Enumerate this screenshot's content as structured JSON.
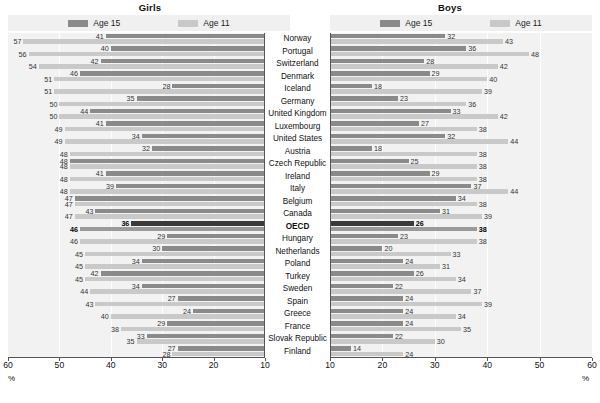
{
  "colors": {
    "age15": "#8a8a8a",
    "age11": "#c9c9c9",
    "age15_highlight": "#3a3a3a",
    "age11_highlight": "#9a9a9a",
    "plot_background": "#f2f2f2",
    "legend_background": "#f0f0f0",
    "axis": "#555555"
  },
  "panels": {
    "girls": {
      "title": "Girls",
      "percent_label": "%"
    },
    "boys": {
      "title": "Boys",
      "percent_label": "%"
    }
  },
  "legend": {
    "age15": "Age 15",
    "age11": "Age 11"
  },
  "axis": {
    "girls_ticks": [
      "60",
      "50",
      "40",
      "30",
      "20",
      "10"
    ],
    "boys_ticks": [
      "10",
      "20",
      "30",
      "40",
      "50",
      "60"
    ]
  },
  "chart_data": [
    {
      "type": "bar",
      "title": "Girls",
      "orientation": "horizontal",
      "direction": "reversed",
      "xlabel": "%",
      "ylabel": "",
      "xlim": [
        10,
        60
      ],
      "grid": true,
      "legend": [
        "Age 15",
        "Age 11"
      ],
      "legend_position": "top",
      "categories": [
        "Norway",
        "Portugal",
        "Switzerland",
        "Denmark",
        "Iceland",
        "Germany",
        "United Kingdom",
        "Luxembourg",
        "United States",
        "Austria",
        "Czech Republic",
        "Ireland",
        "Italy",
        "Belgium",
        "Canada",
        "OECD",
        "Hungary",
        "Netherlands",
        "Poland",
        "Turkey",
        "Sweden",
        "Spain",
        "Greece",
        "France",
        "Slovak Republic",
        "Finland"
      ],
      "series": [
        {
          "name": "Age 15",
          "values": [
            41,
            40,
            42,
            46,
            28,
            35,
            44,
            41,
            34,
            32,
            48,
            41,
            39,
            47,
            43,
            36,
            29,
            30,
            34,
            42,
            34,
            27,
            24,
            29,
            33,
            27
          ]
        },
        {
          "name": "Age 11",
          "values": [
            57,
            56,
            54,
            51,
            51,
            50,
            50,
            49,
            49,
            48,
            48,
            48,
            48,
            47,
            47,
            46,
            46,
            45,
            45,
            45,
            44,
            43,
            40,
            38,
            35,
            28
          ]
        }
      ]
    },
    {
      "type": "bar",
      "title": "Boys",
      "orientation": "horizontal",
      "direction": "normal",
      "xlabel": "%",
      "ylabel": "",
      "xlim": [
        10,
        60
      ],
      "grid": true,
      "legend": [
        "Age 15",
        "Age 11"
      ],
      "legend_position": "top",
      "categories": [
        "Norway",
        "Portugal",
        "Switzerland",
        "Denmark",
        "Iceland",
        "Germany",
        "United Kingdom",
        "Luxembourg",
        "United States",
        "Austria",
        "Czech Republic",
        "Ireland",
        "Italy",
        "Belgium",
        "Canada",
        "OECD",
        "Hungary",
        "Netherlands",
        "Poland",
        "Turkey",
        "Sweden",
        "Spain",
        "Greece",
        "France",
        "Slovak Republic",
        "Finland"
      ],
      "series": [
        {
          "name": "Age 15",
          "values": [
            32,
            36,
            28,
            29,
            18,
            23,
            33,
            27,
            32,
            18,
            25,
            29,
            37,
            34,
            31,
            26,
            23,
            20,
            24,
            26,
            22,
            24,
            24,
            24,
            22,
            14
          ]
        },
        {
          "name": "Age 11",
          "values": [
            43,
            48,
            42,
            40,
            39,
            36,
            42,
            38,
            44,
            38,
            38,
            38,
            44,
            38,
            39,
            38,
            38,
            33,
            31,
            34,
            37,
            39,
            34,
            35,
            30,
            24
          ]
        }
      ]
    }
  ],
  "rows": [
    {
      "country": "Norway",
      "girls15": 41,
      "girls11": 57,
      "boys15": 32,
      "boys11": 43,
      "highlight": false
    },
    {
      "country": "Portugal",
      "girls15": 40,
      "girls11": 56,
      "boys15": 36,
      "boys11": 48,
      "highlight": false
    },
    {
      "country": "Switzerland",
      "girls15": 42,
      "girls11": 54,
      "boys15": 28,
      "boys11": 42,
      "highlight": false
    },
    {
      "country": "Denmark",
      "girls15": 46,
      "girls11": 51,
      "boys15": 29,
      "boys11": 40,
      "highlight": false
    },
    {
      "country": "Iceland",
      "girls15": 28,
      "girls11": 51,
      "boys15": 18,
      "boys11": 39,
      "highlight": false
    },
    {
      "country": "Germany",
      "girls15": 35,
      "girls11": 50,
      "boys15": 23,
      "boys11": 36,
      "highlight": false
    },
    {
      "country": "United Kingdom",
      "girls15": 44,
      "girls11": 50,
      "boys15": 33,
      "boys11": 42,
      "highlight": false
    },
    {
      "country": "Luxembourg",
      "girls15": 41,
      "girls11": 49,
      "boys15": 27,
      "boys11": 38,
      "highlight": false
    },
    {
      "country": "United States",
      "girls15": 34,
      "girls11": 49,
      "boys15": 32,
      "boys11": 44,
      "highlight": false
    },
    {
      "country": "Austria",
      "girls15": 32,
      "girls11": 48,
      "boys15": 18,
      "boys11": 38,
      "highlight": false
    },
    {
      "country": "Czech Republic",
      "girls15": 48,
      "girls11": 48,
      "boys15": 25,
      "boys11": 38,
      "highlight": false
    },
    {
      "country": "Ireland",
      "girls15": 41,
      "girls11": 48,
      "boys15": 29,
      "boys11": 38,
      "highlight": false
    },
    {
      "country": "Italy",
      "girls15": 39,
      "girls11": 48,
      "boys15": 37,
      "boys11": 44,
      "highlight": false
    },
    {
      "country": "Belgium",
      "girls15": 47,
      "girls11": 47,
      "boys15": 34,
      "boys11": 38,
      "highlight": false
    },
    {
      "country": "Canada",
      "girls15": 43,
      "girls11": 47,
      "boys15": 31,
      "boys11": 39,
      "highlight": false
    },
    {
      "country": "OECD",
      "girls15": 36,
      "girls11": 46,
      "boys15": 26,
      "boys11": 38,
      "highlight": true
    },
    {
      "country": "Hungary",
      "girls15": 29,
      "girls11": 46,
      "boys15": 23,
      "boys11": 38,
      "highlight": false
    },
    {
      "country": "Netherlands",
      "girls15": 30,
      "girls11": 45,
      "boys15": 20,
      "boys11": 33,
      "highlight": false
    },
    {
      "country": "Poland",
      "girls15": 34,
      "girls11": 45,
      "boys15": 24,
      "boys11": 31,
      "highlight": false
    },
    {
      "country": "Turkey",
      "girls15": 42,
      "girls11": 45,
      "boys15": 26,
      "boys11": 34,
      "highlight": false
    },
    {
      "country": "Sweden",
      "girls15": 34,
      "girls11": 44,
      "boys15": 22,
      "boys11": 37,
      "highlight": false
    },
    {
      "country": "Spain",
      "girls15": 27,
      "girls11": 43,
      "boys15": 24,
      "boys11": 39,
      "highlight": false
    },
    {
      "country": "Greece",
      "girls15": 24,
      "girls11": 40,
      "boys15": 24,
      "boys11": 34,
      "highlight": false
    },
    {
      "country": "France",
      "girls15": 29,
      "girls11": 38,
      "boys15": 24,
      "boys11": 35,
      "highlight": false
    },
    {
      "country": "Slovak Republic",
      "girls15": 33,
      "girls11": 35,
      "boys15": 22,
      "boys11": 30,
      "highlight": false
    },
    {
      "country": "Finland",
      "girls15": 27,
      "girls11": 28,
      "boys15": 14,
      "boys11": 24,
      "highlight": false
    }
  ]
}
